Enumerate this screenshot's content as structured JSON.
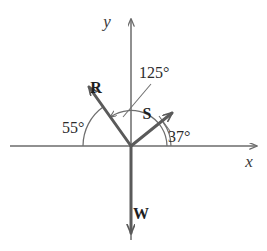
{
  "figure": {
    "background_color": "#ffffff",
    "axis_color": "#6b6b6b",
    "vector_color": "#5a5a5a",
    "arc_color": "#6e6e6e",
    "label_color": "#2b2b2b",
    "origin": {
      "x": 131,
      "y": 146
    }
  },
  "axes": {
    "x": {
      "label": "x",
      "label_x": 249,
      "label_y": 167,
      "start_x": 10,
      "end_x": 261,
      "y": 146
    },
    "y": {
      "label": "y",
      "label_x": 107,
      "label_y": 27,
      "start_y": 240,
      "end_y": 15,
      "x": 131
    }
  },
  "vectors": [
    {
      "name": "R",
      "label": "R",
      "label_x": 96,
      "label_y": 93,
      "tip_x": 84,
      "tip_y": 81,
      "angle_from_positive_x_deg": 125
    },
    {
      "name": "S",
      "label": "S",
      "label_x": 144,
      "label_y": 119,
      "tip_x": 179,
      "tip_y": 107,
      "angle_from_positive_x_deg": 37
    },
    {
      "name": "W",
      "label": "W",
      "label_x": 137,
      "label_y": 219,
      "tip_x": 131,
      "tip_y": 241,
      "angle_from_positive_x_deg": 270
    }
  ],
  "angles": [
    {
      "name": "angle-55",
      "value": "55°",
      "label_x": 62,
      "label_y": 133,
      "measured_between": "negative-x-axis-to-R",
      "arc_radius": 48
    },
    {
      "name": "angle-125",
      "value": "125°",
      "label_x": 139,
      "label_y": 78,
      "measured_between": "positive-x-axis-to-R",
      "arc_radius": 36
    },
    {
      "name": "angle-37",
      "value": "37°",
      "label_x": 168,
      "label_y": 142,
      "measured_between": "positive-x-axis-to-S",
      "arc_radius": 40
    }
  ]
}
